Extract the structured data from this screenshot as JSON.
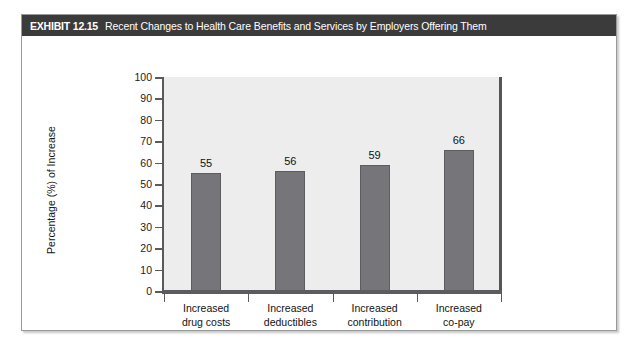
{
  "exhibit": {
    "label": "EXHIBIT 12.15",
    "title": "Recent Changes to Health Care Benefits and Services by Employers Offering Them",
    "header_bg": "#3b3b3b",
    "header_text_color": "#ffffff"
  },
  "chart_data": {
    "type": "bar",
    "title": "Recent Changes to Health Care Benefits and Services by Employers Offering Them",
    "categories": [
      "Increased drug costs",
      "Increased deductibles",
      "Increased contribution",
      "Increased co-pay"
    ],
    "category_lines": [
      [
        "Increased",
        "drug costs"
      ],
      [
        "Increased",
        "deductibles"
      ],
      [
        "Increased",
        "contribution"
      ],
      [
        "Increased",
        "co-pay"
      ]
    ],
    "values": [
      55,
      56,
      59,
      66
    ],
    "value_labels": [
      "55",
      "56",
      "59",
      "66"
    ],
    "xlabel": "",
    "ylabel": "Percentage (%) of Increase",
    "ylim": [
      0,
      100
    ],
    "ytick_step": 10,
    "yticks": [
      0,
      10,
      20,
      30,
      40,
      50,
      60,
      70,
      80,
      90,
      100
    ],
    "ytick_labels": [
      "0",
      "10",
      "20",
      "30",
      "40",
      "50",
      "60",
      "70",
      "80",
      "90",
      "100"
    ],
    "grid": false,
    "legend": null,
    "bar_color": "#76767a",
    "plot_background": "#ededed",
    "axis_color": "#5a5a5a"
  }
}
